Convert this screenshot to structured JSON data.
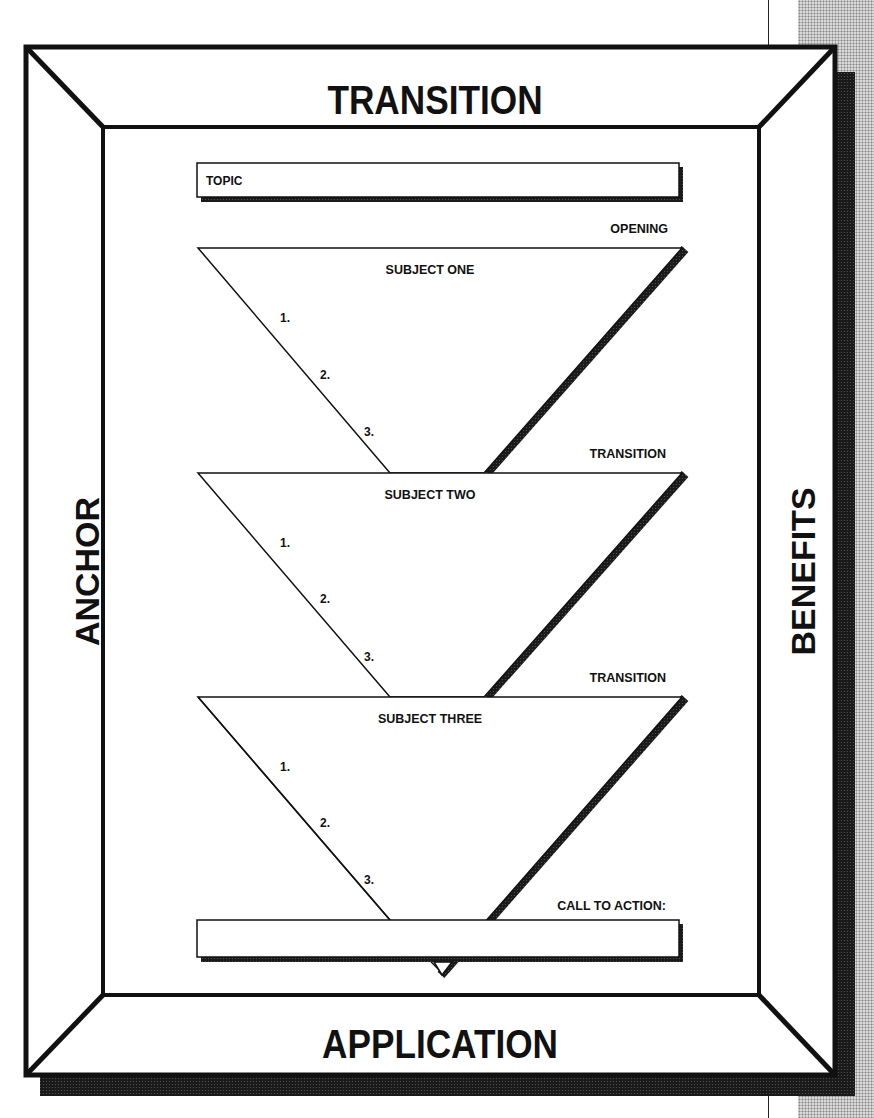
{
  "frame": {
    "top_label": "TRANSITION",
    "bottom_label": "APPLICATION",
    "left_label": "ANCHOR",
    "right_label": "BENEFITS"
  },
  "topic_box": {
    "label": "TOPIC"
  },
  "sections": [
    {
      "transition_label": "OPENING",
      "subject": "SUBJECT ONE",
      "points": [
        "1.",
        "2.",
        "3."
      ]
    },
    {
      "transition_label": "TRANSITION",
      "subject": "SUBJECT TWO",
      "points": [
        "1.",
        "2.",
        "3."
      ]
    },
    {
      "transition_label": "TRANSITION",
      "subject": "SUBJECT THREE",
      "points": [
        "1.",
        "2.",
        "3."
      ]
    }
  ],
  "call_to_action": {
    "label": "CALL TO ACTION:"
  },
  "colors": {
    "ink": "#111111",
    "paper": "#ffffff",
    "halftone": "#8a8a8a"
  }
}
